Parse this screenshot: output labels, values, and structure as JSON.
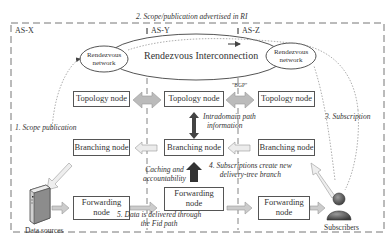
{
  "domains": {
    "as_x": "AS-X",
    "as_y": "AS-Y",
    "as_z": "AS-Z"
  },
  "rendezvous": {
    "left": "Rendezvous network",
    "center": "Rendezvous Interconnection",
    "right": "Rendezvous network"
  },
  "nodes": {
    "topology_x": "Topology node",
    "topology_y": "Topology node",
    "topology_z": "Topology node",
    "branching_x": "Branching node",
    "branching_y": "Branching node",
    "branching_z": "Branching node",
    "forwarding_x": "Forwarding node",
    "forwarding_y": "Forwarding node",
    "forwarding_z": "Forwarding node"
  },
  "endpoints": {
    "data_sources": "Data sources",
    "subscribers": "Subscribers"
  },
  "annotations": {
    "step1": "1. Scope publication",
    "step2": "2. Scope/publication advertised in RI",
    "step3": "3. Subscription",
    "step4_line1": "4. Subscriptions create new",
    "step4_line2": "delivery-tree branch",
    "step5_line1": "5. Data is delivered through",
    "step5_line2": "the Fid path",
    "bgp": "\"BGP\"",
    "intradomain_line1": "Intradomain path",
    "intradomain_line2": "information",
    "caching_line1": "Caching and",
    "caching_line2": "accountability"
  },
  "icons": {
    "server": "server-icon",
    "user": "user-icon"
  }
}
